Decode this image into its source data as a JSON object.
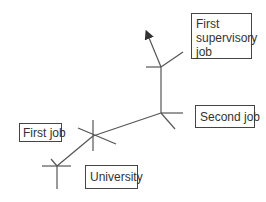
{
  "diagram": {
    "type": "career path",
    "line_color": "#555555",
    "nodes": [
      {
        "id": "university",
        "label": "University"
      },
      {
        "id": "first_job",
        "label": "First job"
      },
      {
        "id": "second_job",
        "label": "Second job"
      },
      {
        "id": "first_supervisory_job",
        "label": "First supervisory job",
        "lines": [
          "First",
          "supervisory",
          "job"
        ]
      }
    ],
    "edges": [
      {
        "from": "university",
        "to": "first_job"
      },
      {
        "from": "first_job",
        "to": "second_job"
      },
      {
        "from": "second_job",
        "to": "first_supervisory_job"
      },
      {
        "from": "first_supervisory_job",
        "to": "arrow (continuing)"
      }
    ]
  }
}
